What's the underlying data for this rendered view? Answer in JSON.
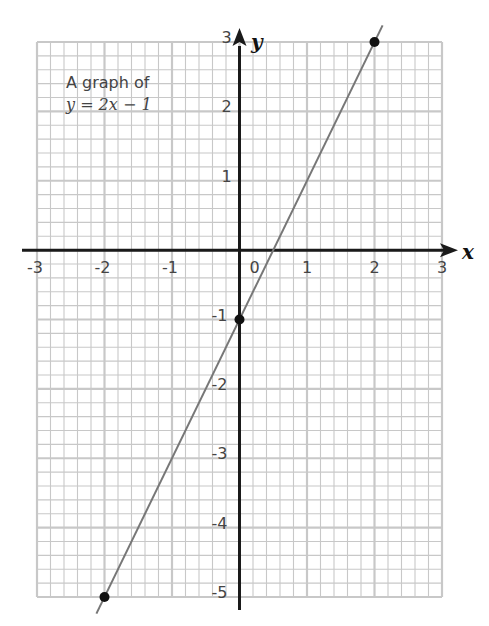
{
  "chart_data": {
    "type": "line",
    "title": "A graph of",
    "subtitle": "y = 2x − 1",
    "xlabel": "x",
    "ylabel": "y",
    "xlim": [
      -3,
      3
    ],
    "ylim": [
      -5,
      3
    ],
    "grid": true,
    "minor_divisions_per_unit": 5,
    "x_ticks": [
      "-3",
      "-2",
      "-1",
      "0",
      "1",
      "2",
      "3"
    ],
    "y_ticks": [
      "3",
      "2",
      "1",
      "-1",
      "-2",
      "-3",
      "-4",
      "-5"
    ],
    "series": [
      {
        "name": "y = 2x − 1",
        "x": [
          -2,
          0,
          2
        ],
        "y": [
          -5,
          -1,
          3
        ],
        "marked_points": [
          [
            -2,
            -5
          ],
          [
            0,
            -1
          ],
          [
            2,
            3
          ]
        ]
      }
    ],
    "colors": {
      "grid": "#c8c8c8",
      "axis": "#1a1a1a",
      "line": "#777777",
      "point": "#111111"
    }
  }
}
